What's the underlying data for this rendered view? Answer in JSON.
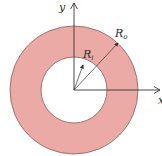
{
  "diagram": {
    "title": "",
    "shape": "annulus",
    "colors": {
      "ring_fill": "#ecaaa6",
      "ring_stroke": "#8a5a58",
      "hole_fill": "#ffffff",
      "axis": "#333333",
      "text": "#2a2a2a"
    },
    "geometry": {
      "center": [
        74,
        90
      ],
      "outer_radius": 64,
      "inner_radius": 33
    },
    "axes": {
      "y_label": "y",
      "x_label": "x"
    },
    "labels": {
      "outer_radius": {
        "main": "R",
        "sub": "o"
      },
      "inner_radius": {
        "main": "R",
        "sub": "i"
      }
    }
  }
}
